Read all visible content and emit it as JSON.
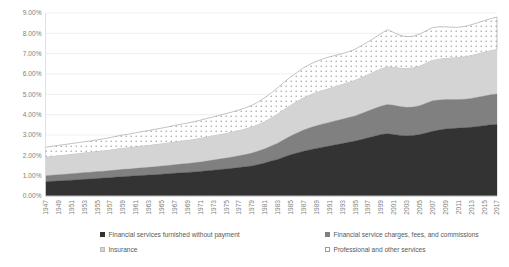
{
  "chart_data": {
    "type": "area",
    "stacked": true,
    "title": "",
    "subtitle": "",
    "xlabel": "",
    "ylabel": "",
    "ylim": [
      0,
      0.09
    ],
    "grid": true,
    "legend_position": "bottom",
    "y_tick_labels": [
      "9.00%",
      "8.00%",
      "7.00%",
      "6.00%",
      "5.00%",
      "4.00%",
      "3.00%",
      "2.00%",
      "1.00%",
      "0.00%"
    ],
    "y_tick_values": [
      9.0,
      8.0,
      7.0,
      6.0,
      5.0,
      4.0,
      3.0,
      2.0,
      1.0,
      0.0
    ],
    "x_tick_labels": [
      "1947",
      "1949",
      "1951",
      "1953",
      "1955",
      "1957",
      "1959",
      "1961",
      "1963",
      "1965",
      "1967",
      "1969",
      "1971",
      "1973",
      "1975",
      "1977",
      "1979",
      "1981",
      "1983",
      "1985",
      "1987",
      "1989",
      "1991",
      "1993",
      "1995",
      "1997",
      "1999",
      "2001",
      "2003",
      "2005",
      "2007",
      "2009",
      "2011",
      "2013",
      "2015",
      "2017"
    ],
    "x": [
      1947,
      1948,
      1949,
      1950,
      1951,
      1952,
      1953,
      1954,
      1955,
      1956,
      1957,
      1958,
      1959,
      1960,
      1961,
      1962,
      1963,
      1964,
      1965,
      1966,
      1967,
      1968,
      1969,
      1970,
      1971,
      1972,
      1973,
      1974,
      1975,
      1976,
      1977,
      1978,
      1979,
      1980,
      1981,
      1982,
      1983,
      1984,
      1985,
      1986,
      1987,
      1988,
      1989,
      1990,
      1991,
      1992,
      1993,
      1994,
      1995,
      1996,
      1997,
      1998,
      1999,
      2000,
      2001,
      2002,
      2003,
      2004,
      2005,
      2006,
      2007,
      2008,
      2009,
      2010,
      2011,
      2012,
      2013,
      2014,
      2015,
      2016,
      2017
    ],
    "series": [
      {
        "name": "Financial services furnished without payment",
        "color": "#333333",
        "pattern": "solid",
        "values": [
          0.7,
          0.72,
          0.74,
          0.76,
          0.78,
          0.8,
          0.82,
          0.84,
          0.86,
          0.88,
          0.9,
          0.93,
          0.95,
          0.97,
          0.99,
          1.01,
          1.03,
          1.05,
          1.07,
          1.09,
          1.12,
          1.14,
          1.16,
          1.18,
          1.21,
          1.24,
          1.27,
          1.3,
          1.33,
          1.36,
          1.4,
          1.44,
          1.48,
          1.55,
          1.62,
          1.72,
          1.8,
          1.92,
          2.03,
          2.12,
          2.2,
          2.28,
          2.34,
          2.4,
          2.46,
          2.52,
          2.58,
          2.64,
          2.7,
          2.78,
          2.86,
          2.94,
          3.02,
          3.06,
          3.02,
          2.98,
          2.96,
          2.98,
          3.02,
          3.1,
          3.18,
          3.24,
          3.3,
          3.32,
          3.34,
          3.36,
          3.38,
          3.42,
          3.46,
          3.5,
          3.52
        ]
      },
      {
        "name": "Financial service charges, fees, and commissions",
        "color": "#808080",
        "pattern": "solid",
        "values": [
          0.3,
          0.3,
          0.31,
          0.31,
          0.32,
          0.32,
          0.33,
          0.33,
          0.34,
          0.34,
          0.35,
          0.35,
          0.36,
          0.36,
          0.37,
          0.38,
          0.38,
          0.39,
          0.4,
          0.41,
          0.42,
          0.43,
          0.44,
          0.45,
          0.46,
          0.48,
          0.5,
          0.52,
          0.54,
          0.56,
          0.58,
          0.6,
          0.63,
          0.66,
          0.7,
          0.74,
          0.8,
          0.86,
          0.92,
          0.98,
          1.04,
          1.08,
          1.12,
          1.14,
          1.16,
          1.18,
          1.2,
          1.22,
          1.24,
          1.28,
          1.32,
          1.36,
          1.4,
          1.44,
          1.44,
          1.42,
          1.4,
          1.4,
          1.42,
          1.46,
          1.5,
          1.48,
          1.44,
          1.42,
          1.4,
          1.4,
          1.42,
          1.44,
          1.46,
          1.48,
          1.5
        ]
      },
      {
        "name": "Insurance",
        "color": "#d4d4d4",
        "pattern": "solid",
        "values": [
          0.9,
          0.91,
          0.92,
          0.93,
          0.94,
          0.95,
          0.96,
          0.97,
          0.98,
          0.99,
          1.0,
          1.02,
          1.03,
          1.04,
          1.05,
          1.06,
          1.07,
          1.08,
          1.09,
          1.1,
          1.11,
          1.12,
          1.13,
          1.14,
          1.16,
          1.17,
          1.18,
          1.19,
          1.2,
          1.22,
          1.23,
          1.25,
          1.27,
          1.3,
          1.33,
          1.37,
          1.42,
          1.46,
          1.5,
          1.54,
          1.58,
          1.6,
          1.62,
          1.64,
          1.66,
          1.68,
          1.7,
          1.72,
          1.74,
          1.76,
          1.78,
          1.8,
          1.82,
          1.84,
          1.86,
          1.88,
          1.9,
          1.92,
          1.94,
          1.96,
          1.98,
          2.0,
          2.02,
          2.04,
          2.06,
          2.08,
          2.1,
          2.12,
          2.14,
          2.16,
          2.18
        ]
      },
      {
        "name": "Professional and other services",
        "color": "#ffffff",
        "pattern": "dotted",
        "values": [
          0.5,
          0.51,
          0.52,
          0.53,
          0.54,
          0.55,
          0.56,
          0.57,
          0.58,
          0.6,
          0.62,
          0.64,
          0.66,
          0.68,
          0.7,
          0.72,
          0.74,
          0.76,
          0.78,
          0.8,
          0.82,
          0.84,
          0.86,
          0.88,
          0.9,
          0.92,
          0.94,
          0.96,
          0.98,
          1.0,
          1.02,
          1.05,
          1.08,
          1.12,
          1.18,
          1.24,
          1.3,
          1.36,
          1.4,
          1.44,
          1.48,
          1.52,
          1.54,
          1.56,
          1.56,
          1.54,
          1.52,
          1.52,
          1.54,
          1.58,
          1.62,
          1.68,
          1.74,
          1.84,
          1.72,
          1.62,
          1.58,
          1.56,
          1.58,
          1.6,
          1.62,
          1.6,
          1.56,
          1.52,
          1.5,
          1.5,
          1.52,
          1.54,
          1.56,
          1.58,
          1.6
        ]
      }
    ]
  },
  "legend": {
    "items": [
      {
        "label": "Financial services furnished without payment",
        "swatch": "sw-dark"
      },
      {
        "label": "Financial service charges, fees, and commissions",
        "swatch": "sw-medium"
      },
      {
        "label": "Insurance",
        "swatch": "sw-light"
      },
      {
        "label": "Professional and other services",
        "swatch": "sw-dotted"
      }
    ]
  }
}
